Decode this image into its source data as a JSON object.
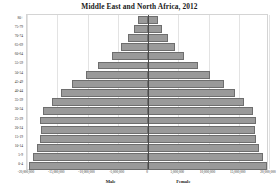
{
  "chart_data": {
    "type": "bar",
    "title": "Middle East and North Africa, 2012",
    "subtype": "population-pyramid",
    "xlabel": "",
    "ylabel": "",
    "xlim": [
      -20000000,
      20000000
    ],
    "grid": true,
    "legend_position": "none",
    "bar_color": "#9a9a9a",
    "bar_border_color": "#6e6e6e",
    "axis_line_color": "#4a4a4a",
    "gridline_color": "#e3e3e3",
    "categories": [
      "80+",
      "75-79",
      "70-74",
      "65-69",
      "60-64",
      "55-59",
      "50-54",
      "45-49",
      "40-44",
      "35-39",
      "30-34",
      "25-29",
      "20-24",
      "15-19",
      "10-14",
      "5-9",
      "0-4"
    ],
    "series": [
      {
        "name": "Male",
        "side": "left",
        "values": [
          -1700000,
          -2300000,
          -3300000,
          -4400000,
          -6000000,
          -8200000,
          -10300000,
          -12600000,
          -14400000,
          -15900000,
          -17300000,
          -17800000,
          -17700000,
          -17900000,
          -18300000,
          -19000000,
          -19700000
        ]
      },
      {
        "name": "Female",
        "side": "right",
        "values": [
          1700000,
          2300000,
          3300000,
          4400000,
          6000000,
          8200000,
          10300000,
          12600000,
          14400000,
          15900000,
          17300000,
          17800000,
          17700000,
          17900000,
          18300000,
          19000000,
          19700000
        ]
      }
    ],
    "x_ticks": [
      {
        "value": -20000000,
        "label": "-20,000,000"
      },
      {
        "value": -15000000,
        "label": "-15,000,000"
      },
      {
        "value": -10000000,
        "label": "-10,000,000"
      },
      {
        "value": -5000000,
        "label": "-5,000,000"
      },
      {
        "value": 0,
        "label": "0"
      },
      {
        "value": 5000000,
        "label": "5,000,000"
      },
      {
        "value": 10000000,
        "label": "10,000,000"
      },
      {
        "value": 15000000,
        "label": "15,000,000"
      },
      {
        "value": 20000000,
        "label": "20,000,000"
      }
    ],
    "sex_labels": [
      {
        "text": "Male",
        "value": -6000000
      },
      {
        "text": "Female",
        "value": 6000000
      }
    ]
  }
}
